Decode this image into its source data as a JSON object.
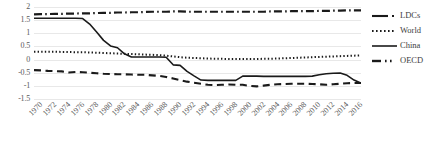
{
  "chart_data": {
    "type": "line",
    "title": "",
    "xlabel": "",
    "ylabel": "",
    "ylim": [
      -1.5,
      2
    ],
    "xlim": [
      1970,
      2017
    ],
    "grid": true,
    "legend_position": "right",
    "yticks": [
      "2",
      "1.5",
      "1",
      "0.5",
      "0",
      "-0.5",
      "-1",
      "-1.5"
    ],
    "ytick_values": [
      2,
      1.5,
      1,
      0.5,
      0,
      -0.5,
      -1,
      -1.5
    ],
    "xticks": [
      "1970",
      "1972",
      "1974",
      "1976",
      "1978",
      "1980",
      "1982",
      "1984",
      "1986",
      "1988",
      "1990",
      "1992",
      "1994",
      "1996",
      "1998",
      "2000",
      "2002",
      "2004",
      "2006",
      "2008",
      "2010",
      "2012",
      "2014",
      "2016"
    ],
    "x": [
      1970,
      1971,
      1972,
      1973,
      1974,
      1975,
      1976,
      1977,
      1978,
      1979,
      1980,
      1981,
      1982,
      1983,
      1984,
      1985,
      1986,
      1987,
      1988,
      1989,
      1990,
      1991,
      1992,
      1993,
      1994,
      1995,
      1996,
      1997,
      1998,
      1999,
      2000,
      2001,
      2002,
      2003,
      2004,
      2005,
      2006,
      2007,
      2008,
      2009,
      2010,
      2011,
      2012,
      2013,
      2014,
      2015,
      2016,
      2017
    ],
    "series": [
      {
        "name": "LDCs",
        "style": "long-dash",
        "color": "#1a1a1a",
        "values": [
          -0.4,
          -0.41,
          -0.43,
          -0.44,
          -0.45,
          -0.49,
          -0.47,
          -0.48,
          -0.5,
          -0.52,
          -0.54,
          -0.55,
          -0.56,
          -0.56,
          -0.57,
          -0.58,
          -0.58,
          -0.6,
          -0.62,
          -0.66,
          -0.72,
          -0.78,
          -0.84,
          -0.88,
          -0.92,
          -0.96,
          -0.97,
          -0.96,
          -0.95,
          -0.96,
          -0.96,
          -1.0,
          -1.02,
          -0.99,
          -0.96,
          -0.94,
          -0.93,
          -0.92,
          -0.92,
          -0.92,
          -0.93,
          -0.94,
          -0.96,
          -0.94,
          -0.92,
          -0.9,
          -0.89,
          -0.89
        ]
      },
      {
        "name": "World",
        "style": "dotted",
        "color": "#1a1a1a",
        "values": [
          0.3,
          0.3,
          0.3,
          0.3,
          0.29,
          0.29,
          0.28,
          0.28,
          0.27,
          0.26,
          0.25,
          0.24,
          0.23,
          0.22,
          0.21,
          0.2,
          0.19,
          0.18,
          0.17,
          0.15,
          0.12,
          0.09,
          0.07,
          0.06,
          0.05,
          0.04,
          0.03,
          0.03,
          0.02,
          0.02,
          0.02,
          0.02,
          0.02,
          0.03,
          0.03,
          0.04,
          0.05,
          0.06,
          0.07,
          0.08,
          0.09,
          0.1,
          0.11,
          0.12,
          0.13,
          0.14,
          0.15,
          0.16
        ]
      },
      {
        "name": "China",
        "style": "solid",
        "color": "#1a1a1a",
        "values": [
          1.57,
          1.57,
          1.57,
          1.57,
          1.57,
          1.57,
          1.57,
          1.56,
          1.35,
          1.05,
          0.73,
          0.52,
          0.45,
          0.22,
          0.1,
          0.1,
          0.1,
          0.1,
          0.1,
          0.09,
          -0.2,
          -0.22,
          -0.45,
          -0.62,
          -0.78,
          -0.79,
          -0.79,
          -0.79,
          -0.79,
          -0.79,
          -0.63,
          -0.63,
          -0.63,
          -0.64,
          -0.64,
          -0.64,
          -0.64,
          -0.64,
          -0.64,
          -0.64,
          -0.63,
          -0.58,
          -0.54,
          -0.52,
          -0.51,
          -0.6,
          -0.78,
          -0.9
        ]
      },
      {
        "name": "OECD",
        "style": "dash-dot",
        "color": "#1a1a1a",
        "values": [
          1.72,
          1.73,
          1.73,
          1.74,
          1.74,
          1.75,
          1.75,
          1.76,
          1.76,
          1.77,
          1.78,
          1.78,
          1.79,
          1.79,
          1.8,
          1.8,
          1.81,
          1.82,
          1.82,
          1.82,
          1.83,
          1.83,
          1.82,
          1.82,
          1.82,
          1.82,
          1.82,
          1.82,
          1.82,
          1.82,
          1.82,
          1.82,
          1.82,
          1.82,
          1.83,
          1.83,
          1.83,
          1.84,
          1.84,
          1.84,
          1.84,
          1.85,
          1.85,
          1.86,
          1.86,
          1.87,
          1.87,
          1.87
        ]
      }
    ]
  },
  "legend": {
    "items": [
      {
        "label": "LDCs"
      },
      {
        "label": "World"
      },
      {
        "label": "China"
      },
      {
        "label": "OECD"
      }
    ]
  }
}
